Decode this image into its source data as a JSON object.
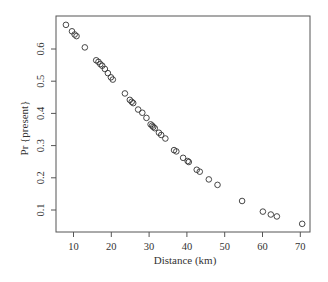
{
  "chart_data": {
    "type": "scatter",
    "title": "",
    "xlabel": "Distance (km)",
    "ylabel": "Pr {present}",
    "xlim": [
      6.5,
      73
    ],
    "ylim": [
      0.03,
      0.7
    ],
    "xticks": [
      10,
      20,
      30,
      40,
      50,
      60,
      70
    ],
    "yticks": [
      0.1,
      0.2,
      0.3,
      0.4,
      0.5,
      0.6
    ],
    "ytick_labels": [
      "0.1",
      "0.2",
      "0.3",
      "0.4",
      "0.5",
      "0.6"
    ],
    "xtick_labels": [
      "10",
      "20",
      "30",
      "40",
      "50",
      "60",
      "70"
    ],
    "grid": false,
    "legend": null,
    "marker": "open-circle",
    "marker_color": "#333333",
    "points": [
      {
        "x": 8.0,
        "y": 0.675
      },
      {
        "x": 9.6,
        "y": 0.655
      },
      {
        "x": 10.3,
        "y": 0.645
      },
      {
        "x": 10.8,
        "y": 0.64
      },
      {
        "x": 13.0,
        "y": 0.605
      },
      {
        "x": 16.0,
        "y": 0.565
      },
      {
        "x": 16.6,
        "y": 0.56
      },
      {
        "x": 17.1,
        "y": 0.553
      },
      {
        "x": 17.6,
        "y": 0.548
      },
      {
        "x": 18.3,
        "y": 0.538
      },
      {
        "x": 19.1,
        "y": 0.525
      },
      {
        "x": 19.9,
        "y": 0.512
      },
      {
        "x": 20.4,
        "y": 0.505
      },
      {
        "x": 23.6,
        "y": 0.462
      },
      {
        "x": 24.9,
        "y": 0.442
      },
      {
        "x": 25.4,
        "y": 0.436
      },
      {
        "x": 25.8,
        "y": 0.432
      },
      {
        "x": 27.1,
        "y": 0.412
      },
      {
        "x": 28.2,
        "y": 0.402
      },
      {
        "x": 29.3,
        "y": 0.386
      },
      {
        "x": 30.4,
        "y": 0.366
      },
      {
        "x": 30.8,
        "y": 0.362
      },
      {
        "x": 31.1,
        "y": 0.358
      },
      {
        "x": 31.5,
        "y": 0.354
      },
      {
        "x": 32.6,
        "y": 0.34
      },
      {
        "x": 33.2,
        "y": 0.333
      },
      {
        "x": 34.3,
        "y": 0.322
      },
      {
        "x": 36.6,
        "y": 0.286
      },
      {
        "x": 37.2,
        "y": 0.282
      },
      {
        "x": 39.0,
        "y": 0.262
      },
      {
        "x": 40.2,
        "y": 0.252
      },
      {
        "x": 40.5,
        "y": 0.249
      },
      {
        "x": 42.6,
        "y": 0.225
      },
      {
        "x": 43.4,
        "y": 0.219
      },
      {
        "x": 45.8,
        "y": 0.195
      },
      {
        "x": 48.1,
        "y": 0.178
      },
      {
        "x": 54.6,
        "y": 0.128
      },
      {
        "x": 60.1,
        "y": 0.095
      },
      {
        "x": 62.2,
        "y": 0.086
      },
      {
        "x": 63.8,
        "y": 0.08
      },
      {
        "x": 70.5,
        "y": 0.057
      }
    ]
  },
  "layout": {
    "plot_left": 56,
    "plot_top": 16,
    "plot_right": 310,
    "plot_bottom": 232
  }
}
